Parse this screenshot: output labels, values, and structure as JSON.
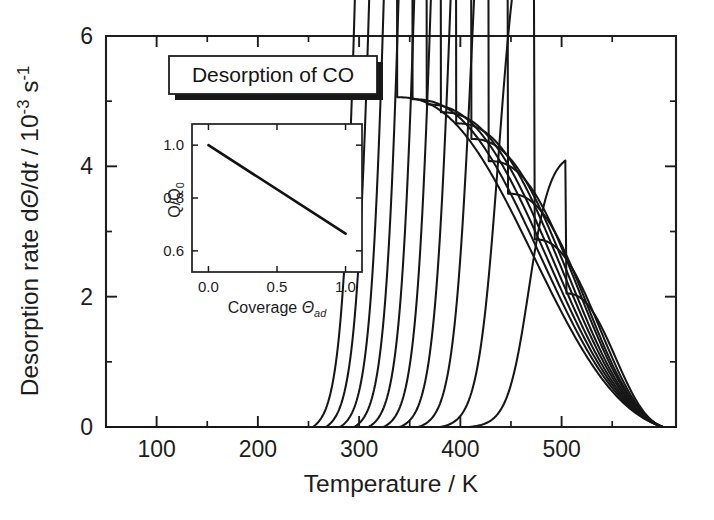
{
  "figure": {
    "background_color": "#ffffff",
    "line_color": "#161616"
  },
  "title_box": {
    "label": "Desorption of CO",
    "has_drop_shadow": true
  },
  "axes": {
    "x": {
      "title_prefix": "Temperature / ",
      "title_unit": "K",
      "title_full": "Temperature / K",
      "tick_labels": [
        "100",
        "200",
        "300",
        "400",
        "500"
      ],
      "tick_values": [
        100,
        200,
        300,
        400,
        500
      ],
      "minor_tick_values": [
        150,
        250,
        350,
        450,
        550
      ],
      "range": [
        50,
        613
      ]
    },
    "y": {
      "title_full": "Desorption rate dΘ/dt / 10⁻³ s⁻¹",
      "title_part1": "Desorption rate d",
      "title_theta": "Θ",
      "title_part2": "/d",
      "title_t": "t",
      "title_part3": " / 10",
      "title_exp1": "-3",
      "title_part4": " s",
      "title_exp2": "-1",
      "tick_labels": [
        "0",
        "2",
        "4",
        "6"
      ],
      "tick_values": [
        0,
        2,
        4,
        6
      ],
      "minor_tick_values": [
        1,
        3,
        5
      ],
      "range": [
        0,
        6
      ]
    }
  },
  "inset": {
    "x": {
      "title_prefix": "Coverage ",
      "title_symbol": "Θ",
      "title_subscript": "ad",
      "title_full": "Coverage Θad",
      "tick_labels": [
        "0.0",
        "0.5",
        "1.0"
      ],
      "tick_values": [
        0.0,
        0.5,
        1.0
      ],
      "range": [
        -0.12,
        1.12
      ]
    },
    "y": {
      "title_numerator": "Q",
      "title_denominator": "Q",
      "title_subscript": "0",
      "title_full": "Q/Q0",
      "tick_labels": [
        "0.6",
        "0.8",
        "1.0"
      ],
      "tick_values": [
        0.6,
        0.8,
        1.0
      ],
      "range": [
        0.52,
        1.08
      ]
    }
  },
  "chart_data": {
    "type": "line",
    "title": "Desorption of CO",
    "xlabel": "Temperature / K",
    "ylabel": "Desorption rate dΘ/dt / 10⁻³ s⁻¹",
    "xlim": [
      50,
      613
    ],
    "ylim": [
      0,
      6
    ],
    "xticks": [
      100,
      200,
      300,
      400,
      500
    ],
    "yticks": [
      0,
      2,
      4,
      6
    ],
    "grid": false,
    "legend": false,
    "n_series": 10,
    "series": [
      {
        "name": "coverage 1.00",
        "initial_coverage": 1.0,
        "onset_K": 262,
        "peak_K": 337,
        "peak_value": 5.06,
        "end_K": 600
      },
      {
        "name": "coverage 0.90",
        "initial_coverage": 0.9,
        "onset_K": 275,
        "peak_K": 352,
        "peak_value": 5.03,
        "end_K": 600
      },
      {
        "name": "coverage 0.80",
        "initial_coverage": 0.8,
        "onset_K": 289,
        "peak_K": 366,
        "peak_value": 4.95,
        "end_K": 600
      },
      {
        "name": "coverage 0.70",
        "initial_coverage": 0.7,
        "onset_K": 303,
        "peak_K": 380,
        "peak_value": 4.83,
        "end_K": 600
      },
      {
        "name": "coverage 0.60",
        "initial_coverage": 0.6,
        "onset_K": 317,
        "peak_K": 395,
        "peak_value": 4.66,
        "end_K": 600
      },
      {
        "name": "coverage 0.50",
        "initial_coverage": 0.5,
        "onset_K": 332,
        "peak_K": 410,
        "peak_value": 4.42,
        "end_K": 600
      },
      {
        "name": "coverage 0.40",
        "initial_coverage": 0.4,
        "onset_K": 348,
        "peak_K": 428,
        "peak_value": 4.08,
        "end_K": 600
      },
      {
        "name": "coverage 0.30",
        "initial_coverage": 0.3,
        "onset_K": 366,
        "peak_K": 447,
        "peak_value": 3.58,
        "end_K": 600
      },
      {
        "name": "coverage 0.20",
        "initial_coverage": 0.2,
        "onset_K": 388,
        "peak_K": 473,
        "peak_value": 2.88,
        "end_K": 600
      },
      {
        "name": "coverage 0.12",
        "initial_coverage": 0.12,
        "onset_K": 416,
        "peak_K": 504,
        "peak_value": 2.05,
        "end_K": 600
      }
    ],
    "inset_chart": {
      "type": "line",
      "xlabel": "Coverage Θad",
      "ylabel": "Q/Q0",
      "xlim": [
        -0.12,
        1.12
      ],
      "ylim": [
        0.52,
        1.08
      ],
      "xticks": [
        0.0,
        0.5,
        1.0
      ],
      "yticks": [
        0.6,
        0.8,
        1.0
      ],
      "x": [
        0.0,
        1.0
      ],
      "y": [
        1.0,
        0.665
      ],
      "description": "Linear decrease of normalized activation energy Q/Q0 with adsorbate coverage"
    }
  }
}
